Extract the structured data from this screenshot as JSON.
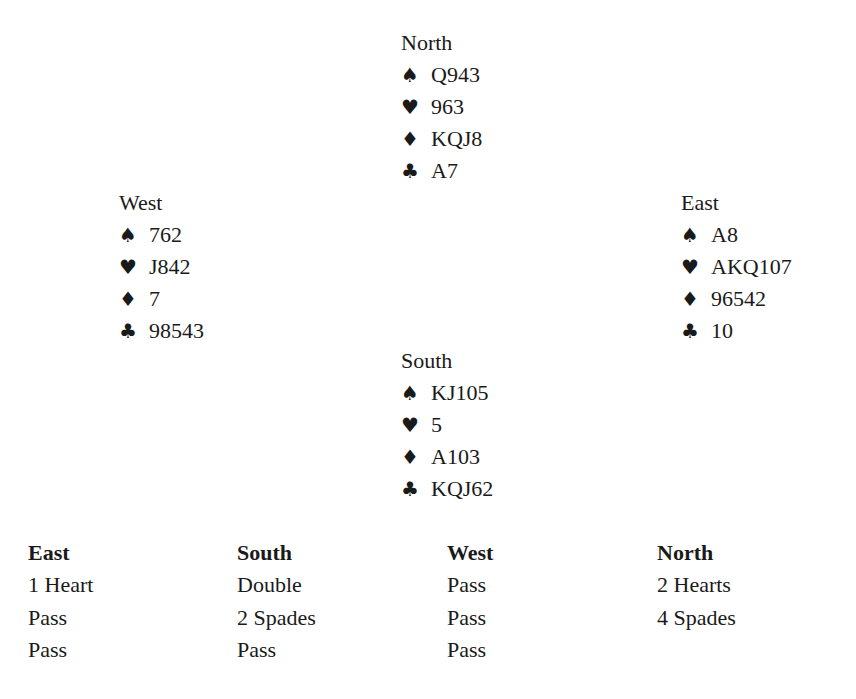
{
  "suits": {
    "spades": "♠",
    "hearts": "♥",
    "diamonds": "♦",
    "clubs": "♣"
  },
  "hands": {
    "north": {
      "label": "North",
      "spades": "Q943",
      "hearts": "963",
      "diamonds": "KQJ8",
      "clubs": "A7"
    },
    "west": {
      "label": "West",
      "spades": "762",
      "hearts": "J842",
      "diamonds": "7",
      "clubs": "98543"
    },
    "east": {
      "label": "East",
      "spades": "A8",
      "hearts": "AKQ107",
      "diamonds": "96542",
      "clubs": "10"
    },
    "south": {
      "label": "South",
      "spades": "KJ105",
      "hearts": "5",
      "diamonds": "A103",
      "clubs": "KQJ62"
    }
  },
  "bidding": {
    "columns": [
      {
        "header": "East",
        "bids": [
          "1 Heart",
          "Pass",
          "Pass"
        ]
      },
      {
        "header": "South",
        "bids": [
          "Double",
          "2 Spades",
          "Pass"
        ]
      },
      {
        "header": "West",
        "bids": [
          "Pass",
          "Pass",
          "Pass"
        ]
      },
      {
        "header": "North",
        "bids": [
          "2 Hearts",
          "4 Spades"
        ]
      }
    ]
  }
}
